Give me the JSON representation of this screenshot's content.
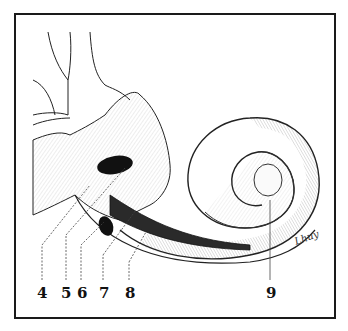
{
  "figure": {
    "signature": "Lhuy",
    "colors": {
      "ink": "#111111",
      "paper": "#ffffff",
      "frame": "#1a1a1a"
    },
    "labels": [
      {
        "id": "4",
        "text": "4",
        "x": 42,
        "y": 296
      },
      {
        "id": "5",
        "text": "5",
        "x": 66,
        "y": 296
      },
      {
        "id": "6",
        "text": "6",
        "x": 81,
        "y": 296
      },
      {
        "id": "7",
        "text": "7",
        "x": 103,
        "y": 296
      },
      {
        "id": "8",
        "text": "8",
        "x": 129,
        "y": 296
      },
      {
        "id": "9",
        "text": "9",
        "x": 270,
        "y": 296
      }
    ]
  }
}
